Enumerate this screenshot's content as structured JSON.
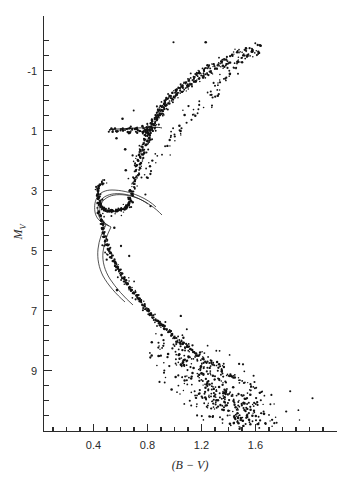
{
  "figure": {
    "title": "",
    "background_color": "#ffffff",
    "ink_color": "#111111"
  },
  "chart_data": {
    "type": "scatter",
    "title": "",
    "subtitle": "",
    "xlabel": "(B − V)",
    "ylabel": "M",
    "ylabel_sub": "V",
    "xlim": [
      0.08,
      2.2
    ],
    "ylim": [
      -2.2,
      11.0
    ],
    "y_inverted": true,
    "grid": false,
    "legend": "none",
    "xticks": [
      0.4,
      0.8,
      1.2,
      1.6
    ],
    "xtick_labels": [
      "0.4",
      "0.8",
      "1.2",
      "1.6"
    ],
    "xtick_minor_step": 0.1,
    "yticks": [
      -1,
      1,
      3,
      5,
      7,
      9
    ],
    "ytick_labels": [
      "-1",
      "1",
      "3",
      "5",
      "7",
      "9"
    ],
    "ytick_minor_step": 0.5,
    "axis_style": "left-and-bottom-spines",
    "annotations": [],
    "series": [
      {
        "name": "cluster-stars",
        "marker": "dot",
        "color": "#111111",
        "points": [
          [
            1.53,
            -1.75
          ],
          [
            1.58,
            -1.66
          ],
          [
            1.47,
            -1.6
          ],
          [
            1.62,
            -1.58
          ],
          [
            1.43,
            -1.52
          ],
          [
            1.55,
            -1.48
          ],
          [
            1.5,
            -1.44
          ],
          [
            1.38,
            -1.4
          ],
          [
            1.35,
            -1.34
          ],
          [
            1.46,
            -1.3
          ],
          [
            1.41,
            -1.26
          ],
          [
            1.33,
            -1.21
          ],
          [
            1.29,
            -1.18
          ],
          [
            1.37,
            -1.13
          ],
          [
            1.25,
            -1.1
          ],
          [
            1.31,
            -1.06
          ],
          [
            1.22,
            -1.02
          ],
          [
            1.27,
            -0.97
          ],
          [
            1.19,
            -0.93
          ],
          [
            1.24,
            -0.89
          ],
          [
            1.16,
            -0.85
          ],
          [
            1.21,
            -0.81
          ],
          [
            1.14,
            -0.76
          ],
          [
            1.18,
            -0.72
          ],
          [
            1.11,
            -0.68
          ],
          [
            1.15,
            -0.63
          ],
          [
            1.08,
            -0.59
          ],
          [
            1.12,
            -0.55
          ],
          [
            1.06,
            -0.51
          ],
          [
            1.1,
            -0.46
          ],
          [
            1.03,
            -0.42
          ],
          [
            1.07,
            -0.38
          ],
          [
            1.01,
            -0.33
          ],
          [
            1.05,
            -0.29
          ],
          [
            0.99,
            -0.25
          ],
          [
            1.02,
            -0.2
          ],
          [
            0.97,
            -0.16
          ],
          [
            1.0,
            -0.12
          ],
          [
            0.95,
            -0.07
          ],
          [
            0.98,
            -0.03
          ],
          [
            0.93,
            0.02
          ],
          [
            0.96,
            0.07
          ],
          [
            0.92,
            0.11
          ],
          [
            0.94,
            0.16
          ],
          [
            0.9,
            0.21
          ],
          [
            0.93,
            0.25
          ],
          [
            0.89,
            0.3
          ],
          [
            0.91,
            0.34
          ],
          [
            0.88,
            0.39
          ],
          [
            0.9,
            0.44
          ],
          [
            0.86,
            0.49
          ],
          [
            0.89,
            0.53
          ],
          [
            0.85,
            0.58
          ],
          [
            0.87,
            0.63
          ],
          [
            0.84,
            0.68
          ],
          [
            0.86,
            0.73
          ],
          [
            0.83,
            0.78
          ],
          [
            0.85,
            0.83
          ],
          [
            0.82,
            0.88
          ],
          [
            0.84,
            0.93
          ],
          [
            0.81,
            0.98
          ],
          [
            0.83,
            1.03
          ],
          [
            0.8,
            1.08
          ],
          [
            0.82,
            1.13
          ],
          [
            0.79,
            1.19
          ],
          [
            0.81,
            1.24
          ],
          [
            0.78,
            1.3
          ],
          [
            0.8,
            1.36
          ],
          [
            0.77,
            1.42
          ],
          [
            0.79,
            1.48
          ],
          [
            0.76,
            1.55
          ],
          [
            0.78,
            1.62
          ],
          [
            0.75,
            1.69
          ],
          [
            0.77,
            1.76
          ],
          [
            0.74,
            1.84
          ],
          [
            0.76,
            1.92
          ],
          [
            0.73,
            2.0
          ],
          [
            0.75,
            2.09
          ],
          [
            0.72,
            2.18
          ],
          [
            0.74,
            2.27
          ],
          [
            0.71,
            2.37
          ],
          [
            0.73,
            2.47
          ],
          [
            0.7,
            2.58
          ],
          [
            0.71,
            2.69
          ],
          [
            0.69,
            2.8
          ],
          [
            0.7,
            2.92
          ],
          [
            0.68,
            3.03
          ],
          [
            0.69,
            3.15
          ],
          [
            0.67,
            3.26
          ],
          [
            0.68,
            3.36
          ],
          [
            0.66,
            3.45
          ],
          [
            0.65,
            3.52
          ],
          [
            0.64,
            3.58
          ],
          [
            0.62,
            3.62
          ],
          [
            0.6,
            3.65
          ],
          [
            0.58,
            3.67
          ],
          [
            0.56,
            3.68
          ],
          [
            0.54,
            3.68
          ],
          [
            0.52,
            3.68
          ],
          [
            0.5,
            3.67
          ],
          [
            0.48,
            3.64
          ],
          [
            0.47,
            3.6
          ],
          [
            0.46,
            3.54
          ],
          [
            0.45,
            3.46
          ],
          [
            0.44,
            3.37
          ],
          [
            0.435,
            3.27
          ],
          [
            0.432,
            3.16
          ],
          [
            0.433,
            3.05
          ],
          [
            0.437,
            2.95
          ],
          [
            0.444,
            2.86
          ],
          [
            0.452,
            2.79
          ],
          [
            0.462,
            2.74
          ],
          [
            0.44,
            3.72
          ],
          [
            0.45,
            3.85
          ],
          [
            0.455,
            3.98
          ],
          [
            0.46,
            4.12
          ],
          [
            0.465,
            4.26
          ],
          [
            0.47,
            4.4
          ],
          [
            0.478,
            4.54
          ],
          [
            0.487,
            4.68
          ],
          [
            0.497,
            4.82
          ],
          [
            0.508,
            4.95
          ],
          [
            0.52,
            5.08
          ],
          [
            0.533,
            5.21
          ],
          [
            0.547,
            5.33
          ],
          [
            0.561,
            5.45
          ],
          [
            0.575,
            5.57
          ],
          [
            0.59,
            5.68
          ],
          [
            0.605,
            5.79
          ],
          [
            0.62,
            5.9
          ],
          [
            0.636,
            6.0
          ],
          [
            0.652,
            6.11
          ],
          [
            0.668,
            6.21
          ],
          [
            0.684,
            6.31
          ],
          [
            0.7,
            6.41
          ],
          [
            0.717,
            6.51
          ],
          [
            0.734,
            6.61
          ],
          [
            0.751,
            6.71
          ],
          [
            0.769,
            6.81
          ],
          [
            0.787,
            6.91
          ],
          [
            0.806,
            7.01
          ],
          [
            0.825,
            7.11
          ],
          [
            0.845,
            7.21
          ],
          [
            0.866,
            7.31
          ],
          [
            0.888,
            7.41
          ],
          [
            0.91,
            7.51
          ],
          [
            0.933,
            7.61
          ],
          [
            0.957,
            7.71
          ],
          [
            0.982,
            7.81
          ],
          [
            1.008,
            7.91
          ],
          [
            1.035,
            8.01
          ],
          [
            1.063,
            8.11
          ],
          [
            1.092,
            8.21
          ],
          [
            1.122,
            8.31
          ],
          [
            1.153,
            8.41
          ],
          [
            1.185,
            8.51
          ],
          [
            1.218,
            8.61
          ],
          [
            1.252,
            8.71
          ],
          [
            1.287,
            8.81
          ],
          [
            1.323,
            8.91
          ],
          [
            1.36,
            9.01
          ],
          [
            1.398,
            9.11
          ],
          [
            1.437,
            9.21
          ],
          [
            1.477,
            9.31
          ],
          [
            1.518,
            9.41
          ],
          [
            1.56,
            9.51
          ],
          [
            1.603,
            9.61
          ],
          [
            1.647,
            9.71
          ]
        ]
      }
    ],
    "overlay_curves": [
      {
        "name": "isochrone-blue-edge",
        "style": "thin-solid"
      },
      {
        "name": "isochrone-red-edge",
        "style": "thin-solid"
      },
      {
        "name": "horizontal-branch-line",
        "style": "thin-solid"
      }
    ],
    "features": [
      {
        "name": "red-giant-branch",
        "mv_range": [
          -2.0,
          2.5
        ]
      },
      {
        "name": "horizontal-branch",
        "mv": 1.0,
        "bv_range": [
          0.5,
          0.82
        ]
      },
      {
        "name": "subgiant-branch",
        "mv_range": [
          2.5,
          3.6
        ]
      },
      {
        "name": "main-sequence-turnoff",
        "mv": 3.6,
        "bv": 0.45
      },
      {
        "name": "main-sequence",
        "mv_range": [
          3.6,
          9.0
        ]
      },
      {
        "name": "faint-scatter-field",
        "mv_range": [
          8.0,
          11.0
        ]
      }
    ]
  }
}
